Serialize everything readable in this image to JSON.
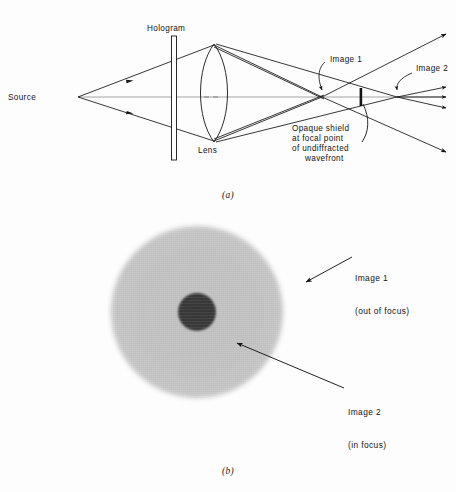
{
  "figure": {
    "domain": "scientific-optics-figure",
    "panels": [
      {
        "id": "a",
        "caption": "(a)",
        "type": "ray-diagram"
      },
      {
        "id": "b",
        "caption": "(b)",
        "type": "photograph"
      }
    ]
  },
  "panel_a": {
    "caption": "(a)",
    "labels": {
      "source": "Source",
      "hologram": "Hologram",
      "lens": "Lens",
      "image1": "Image 1",
      "image2": "Image 2",
      "shield_line1": "Opaque shield",
      "shield_line2": "at focal point",
      "shield_line3": "of undiffracted",
      "shield_line4": "wavefront"
    },
    "components": {
      "source_point": {
        "x": 78,
        "y": 97
      },
      "hologram_plate": {
        "x": 172,
        "y_top": 36,
        "y_bottom": 160,
        "width": 5
      },
      "lens": {
        "x": 213,
        "y_top": 44,
        "y_bottom": 142
      },
      "image1_point": {
        "x": 322,
        "y": 97
      },
      "shield_point": {
        "x": 361,
        "y": 97
      },
      "image2_point": {
        "x": 397,
        "y": 97
      }
    }
  },
  "panel_b": {
    "caption": "(b)",
    "labels": {
      "image1_line1": "Image 1",
      "image1_line2": "(out of focus)",
      "image2_line1": "Image 2",
      "image2_line2": "(in focus)"
    },
    "features": {
      "outer_disc": {
        "description": "large blurred gray disc",
        "color": "#c5c5c5"
      },
      "inner_disc": {
        "description": "small dark focused disc",
        "color": "#3c3c3c"
      }
    }
  },
  "colors": {
    "background": "#fdfdfd",
    "ink": "#141414",
    "axis": "#8a8a8a",
    "outer_disc": "#c5c5c5",
    "inner_disc": "#3c3c3c"
  }
}
